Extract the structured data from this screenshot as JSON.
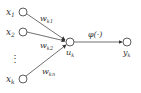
{
  "diagram": {
    "inputs": [
      {
        "label": "x",
        "sub": "1",
        "weight": "w",
        "wsub": "k1"
      },
      {
        "label": "x",
        "sub": "2",
        "weight": "w",
        "wsub": "k2"
      },
      {
        "label": "x",
        "sub": "k",
        "weight": "w",
        "wsub": "kn"
      }
    ],
    "ellipsis": "⋮",
    "sum_node": {
      "label": "u",
      "sub": "k"
    },
    "activation": "φ(·)",
    "output_node": {
      "label": "y",
      "sub": "k"
    },
    "colors": {
      "stroke": "#333333",
      "background": "#ffffff"
    }
  }
}
